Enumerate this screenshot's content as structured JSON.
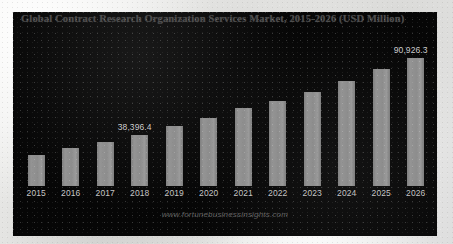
{
  "chart_panel": {
    "title": "Global Contract Research Organization Services Market, 2015-2026 (USD Million)",
    "watermark": "www.fortunebusinessinsights.com",
    "background_color": "#060606",
    "bar_color": "#8b8b8b",
    "title_color": "#4e4e4e",
    "tick_color": "#c6c6c6"
  },
  "chart_data": {
    "type": "bar",
    "title": "Global Contract Research Organization Services Market, 2015-2026 (USD Million)",
    "xlabel": "",
    "ylabel": "USD Million",
    "grid": false,
    "legend": "none",
    "ylim": [
      0,
      100000
    ],
    "categories": [
      "2015",
      "2016",
      "2017",
      "2018",
      "2019",
      "2020",
      "2021",
      "2022",
      "2023",
      "2024",
      "2025",
      "2026"
    ],
    "values": [
      26900,
      31100,
      34300,
      38396.4,
      44600,
      49500,
      55800,
      60400,
      66300,
      74000,
      81900,
      90926.3
    ],
    "data_labels": [
      {
        "category": "2018",
        "text": "38,396.4"
      },
      {
        "category": "2026",
        "text": "90,926.3"
      }
    ],
    "bars": [
      {
        "category": "2015",
        "value": 26900,
        "label": "",
        "bar_height_px": 31
      },
      {
        "category": "2016",
        "value": 31100,
        "label": "",
        "bar_height_px": 38
      },
      {
        "category": "2017",
        "value": 34300,
        "label": "",
        "bar_height_px": 44
      },
      {
        "category": "2018",
        "value": 38396.4,
        "label": "38,396.4",
        "bar_height_px": 51
      },
      {
        "category": "2019",
        "value": 44600,
        "label": "",
        "bar_height_px": 60
      },
      {
        "category": "2020",
        "value": 49500,
        "label": "",
        "bar_height_px": 68
      },
      {
        "category": "2021",
        "value": 55800,
        "label": "",
        "bar_height_px": 78
      },
      {
        "category": "2022",
        "value": 60400,
        "label": "",
        "bar_height_px": 85
      },
      {
        "category": "2023",
        "value": 66300,
        "label": "",
        "bar_height_px": 94
      },
      {
        "category": "2024",
        "value": 74000,
        "label": "",
        "bar_height_px": 105
      },
      {
        "category": "2025",
        "value": 81900,
        "label": "",
        "bar_height_px": 117
      },
      {
        "category": "2026",
        "value": 90926.3,
        "label": "90,926.3",
        "bar_height_px": 128
      }
    ]
  }
}
